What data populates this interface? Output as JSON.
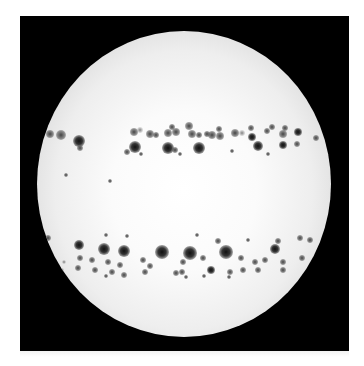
{
  "image": {
    "subject": "solar-disk-with-sunspots",
    "background_color": "#ffffff",
    "frame_color": "#000000",
    "disk": {
      "cx": 184,
      "cy": 184,
      "rx": 147,
      "ry": 153,
      "center_color": "#ffffff",
      "limb_color": "#9d9d9d"
    },
    "sunspots": [
      {
        "x": 50,
        "y": 134,
        "r": 4,
        "k": "small"
      },
      {
        "x": 61,
        "y": 135,
        "r": 5,
        "k": "small"
      },
      {
        "x": 79,
        "y": 141,
        "r": 6,
        "k": ""
      },
      {
        "x": 80,
        "y": 148,
        "r": 3,
        "k": "small"
      },
      {
        "x": 134,
        "y": 132,
        "r": 4,
        "k": "small"
      },
      {
        "x": 140,
        "y": 130,
        "r": 3,
        "k": "faint"
      },
      {
        "x": 150,
        "y": 134,
        "r": 4,
        "k": "small"
      },
      {
        "x": 156,
        "y": 135,
        "r": 3,
        "k": "small"
      },
      {
        "x": 168,
        "y": 133,
        "r": 4,
        "k": "small"
      },
      {
        "x": 172,
        "y": 127,
        "r": 3,
        "k": "small"
      },
      {
        "x": 176,
        "y": 132,
        "r": 4,
        "k": "small"
      },
      {
        "x": 189,
        "y": 126,
        "r": 4,
        "k": "small"
      },
      {
        "x": 192,
        "y": 134,
        "r": 4,
        "k": "small"
      },
      {
        "x": 199,
        "y": 135,
        "r": 3,
        "k": "small"
      },
      {
        "x": 207,
        "y": 134,
        "r": 3,
        "k": "small"
      },
      {
        "x": 212,
        "y": 135,
        "r": 4,
        "k": "small"
      },
      {
        "x": 219,
        "y": 129,
        "r": 3,
        "k": "small"
      },
      {
        "x": 220,
        "y": 136,
        "r": 4,
        "k": "small"
      },
      {
        "x": 235,
        "y": 133,
        "r": 4,
        "k": "small"
      },
      {
        "x": 242,
        "y": 133,
        "r": 3,
        "k": "faint"
      },
      {
        "x": 251,
        "y": 128,
        "r": 3,
        "k": "small"
      },
      {
        "x": 252,
        "y": 137,
        "r": 4,
        "k": ""
      },
      {
        "x": 267,
        "y": 131,
        "r": 3,
        "k": "small"
      },
      {
        "x": 272,
        "y": 127,
        "r": 3,
        "k": "small"
      },
      {
        "x": 283,
        "y": 134,
        "r": 4,
        "k": "small"
      },
      {
        "x": 285,
        "y": 128,
        "r": 3,
        "k": "small"
      },
      {
        "x": 298,
        "y": 132,
        "r": 4,
        "k": ""
      },
      {
        "x": 316,
        "y": 138,
        "r": 3,
        "k": "small"
      },
      {
        "x": 135,
        "y": 147,
        "r": 6,
        "k": ""
      },
      {
        "x": 127,
        "y": 152,
        "r": 3,
        "k": "small"
      },
      {
        "x": 168,
        "y": 148,
        "r": 6,
        "k": ""
      },
      {
        "x": 175,
        "y": 150,
        "r": 3,
        "k": "small"
      },
      {
        "x": 199,
        "y": 148,
        "r": 6,
        "k": ""
      },
      {
        "x": 180,
        "y": 154,
        "r": 2,
        "k": "small"
      },
      {
        "x": 141,
        "y": 154,
        "r": 2,
        "k": "small"
      },
      {
        "x": 258,
        "y": 146,
        "r": 5,
        "k": ""
      },
      {
        "x": 283,
        "y": 145,
        "r": 4,
        "k": ""
      },
      {
        "x": 297,
        "y": 144,
        "r": 3,
        "k": "small"
      },
      {
        "x": 268,
        "y": 154,
        "r": 2,
        "k": "small"
      },
      {
        "x": 232,
        "y": 151,
        "r": 2,
        "k": "small"
      },
      {
        "x": 66,
        "y": 175,
        "r": 2,
        "k": "small"
      },
      {
        "x": 110,
        "y": 181,
        "r": 2,
        "k": "small"
      },
      {
        "x": 48,
        "y": 238,
        "r": 3,
        "k": "small"
      },
      {
        "x": 79,
        "y": 245,
        "r": 5,
        "k": ""
      },
      {
        "x": 104,
        "y": 249,
        "r": 6,
        "k": ""
      },
      {
        "x": 124,
        "y": 251,
        "r": 6,
        "k": ""
      },
      {
        "x": 162,
        "y": 252,
        "r": 7,
        "k": ""
      },
      {
        "x": 190,
        "y": 253,
        "r": 7,
        "k": ""
      },
      {
        "x": 226,
        "y": 252,
        "r": 7,
        "k": ""
      },
      {
        "x": 275,
        "y": 249,
        "r": 5,
        "k": ""
      },
      {
        "x": 218,
        "y": 241,
        "r": 3,
        "k": "small"
      },
      {
        "x": 248,
        "y": 240,
        "r": 2,
        "k": "small"
      },
      {
        "x": 197,
        "y": 235,
        "r": 2,
        "k": "small"
      },
      {
        "x": 106,
        "y": 235,
        "r": 2,
        "k": "small"
      },
      {
        "x": 127,
        "y": 236,
        "r": 2,
        "k": "small"
      },
      {
        "x": 278,
        "y": 241,
        "r": 3,
        "k": "small"
      },
      {
        "x": 300,
        "y": 238,
        "r": 3,
        "k": "small"
      },
      {
        "x": 310,
        "y": 240,
        "r": 3,
        "k": "small"
      },
      {
        "x": 80,
        "y": 258,
        "r": 3,
        "k": "small"
      },
      {
        "x": 92,
        "y": 260,
        "r": 3,
        "k": "small"
      },
      {
        "x": 108,
        "y": 262,
        "r": 3,
        "k": "small"
      },
      {
        "x": 120,
        "y": 265,
        "r": 3,
        "k": "small"
      },
      {
        "x": 143,
        "y": 260,
        "r": 3,
        "k": "small"
      },
      {
        "x": 150,
        "y": 266,
        "r": 3,
        "k": "small"
      },
      {
        "x": 183,
        "y": 262,
        "r": 3,
        "k": "small"
      },
      {
        "x": 203,
        "y": 258,
        "r": 3,
        "k": "small"
      },
      {
        "x": 241,
        "y": 258,
        "r": 3,
        "k": "small"
      },
      {
        "x": 255,
        "y": 262,
        "r": 3,
        "k": "small"
      },
      {
        "x": 265,
        "y": 260,
        "r": 3,
        "k": "small"
      },
      {
        "x": 283,
        "y": 262,
        "r": 3,
        "k": "small"
      },
      {
        "x": 302,
        "y": 258,
        "r": 3,
        "k": "small"
      },
      {
        "x": 78,
        "y": 268,
        "r": 3,
        "k": "small"
      },
      {
        "x": 95,
        "y": 270,
        "r": 3,
        "k": "small"
      },
      {
        "x": 112,
        "y": 272,
        "r": 3,
        "k": "small"
      },
      {
        "x": 124,
        "y": 275,
        "r": 3,
        "k": "small"
      },
      {
        "x": 145,
        "y": 272,
        "r": 3,
        "k": "small"
      },
      {
        "x": 176,
        "y": 273,
        "r": 3,
        "k": "small"
      },
      {
        "x": 182,
        "y": 272,
        "r": 3,
        "k": "small"
      },
      {
        "x": 211,
        "y": 270,
        "r": 4,
        "k": ""
      },
      {
        "x": 230,
        "y": 272,
        "r": 3,
        "k": "small"
      },
      {
        "x": 243,
        "y": 270,
        "r": 3,
        "k": "small"
      },
      {
        "x": 258,
        "y": 270,
        "r": 3,
        "k": "small"
      },
      {
        "x": 283,
        "y": 270,
        "r": 3,
        "k": "small"
      },
      {
        "x": 106,
        "y": 276,
        "r": 2,
        "k": "small"
      },
      {
        "x": 186,
        "y": 277,
        "r": 2,
        "k": "small"
      },
      {
        "x": 204,
        "y": 276,
        "r": 2,
        "k": "small"
      },
      {
        "x": 229,
        "y": 277,
        "r": 2,
        "k": "small"
      },
      {
        "x": 64,
        "y": 262,
        "r": 2,
        "k": "faint"
      },
      {
        "x": 62,
        "y": 270,
        "r": 2,
        "k": "faint"
      }
    ]
  }
}
